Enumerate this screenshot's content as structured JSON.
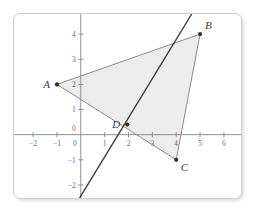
{
  "figure": {
    "type": "coordinate-plane-graph",
    "background_color": "#ffffff",
    "panel_border_color": "#cfcfcf"
  },
  "chart_data": {
    "type": "scatter",
    "title": "",
    "xlabel": "",
    "ylabel": "",
    "xlim": [
      -2.8,
      6.8
    ],
    "ylim": [
      -2.6,
      4.8
    ],
    "grid": false,
    "axis_color": "#8f8f8f",
    "x_ticks": [
      -2,
      -1,
      0,
      1,
      2,
      3,
      4,
      5,
      6
    ],
    "x_tick_labels": [
      "−2",
      "−1",
      "0",
      "1",
      "2",
      "3",
      "4",
      "5",
      "6"
    ],
    "y_ticks": [
      -2,
      -1,
      0,
      1,
      2,
      3,
      4
    ],
    "y_tick_labels": [
      "−2",
      "−1",
      "0",
      "1",
      "2",
      "3",
      "4"
    ],
    "points": [
      {
        "name": "A",
        "label": "A",
        "x": -1,
        "y": 2,
        "label_position": "left"
      },
      {
        "name": "B",
        "label": "B",
        "x": 5,
        "y": 4,
        "label_position": "upper-right"
      },
      {
        "name": "C",
        "label": "C",
        "x": 4,
        "y": -1,
        "label_position": "lower-right"
      },
      {
        "name": "D",
        "label": "D",
        "x": 1.95,
        "y": 0.4,
        "label_position": "left"
      }
    ],
    "polygon": {
      "name": "triangle-ABC",
      "vertices": [
        "A",
        "B",
        "C"
      ],
      "fill_color": "#ececec",
      "stroke_color": "#8a8a8a",
      "closed": true
    },
    "lines": [
      {
        "name": "steep-line",
        "description": "steep line through D",
        "from": {
          "x": -0.1,
          "y": -2.6
        },
        "to": {
          "x": 4.65,
          "y": 4.8
        },
        "color": "#3d3d3d",
        "width": 1.4
      }
    ],
    "annotations": [
      {
        "text": "A",
        "x": -1,
        "y": 2
      },
      {
        "text": "B",
        "x": 5,
        "y": 4
      },
      {
        "text": "C",
        "x": 4,
        "y": -1
      },
      {
        "text": "D",
        "x": 1.95,
        "y": 0.4
      }
    ]
  }
}
